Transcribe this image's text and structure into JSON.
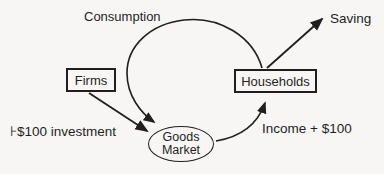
{
  "diagram": {
    "labels": {
      "consumption": "Consumption",
      "saving": "Saving",
      "investment": "⊦$100 investment",
      "income": "Income + $100"
    },
    "nodes": {
      "firms": "Firms",
      "households": "Households",
      "goods_market_line1": "Goods",
      "goods_market_line2": "Market"
    },
    "colors": {
      "ink": "#1f1f1f",
      "background": "#f7f6f4"
    }
  }
}
